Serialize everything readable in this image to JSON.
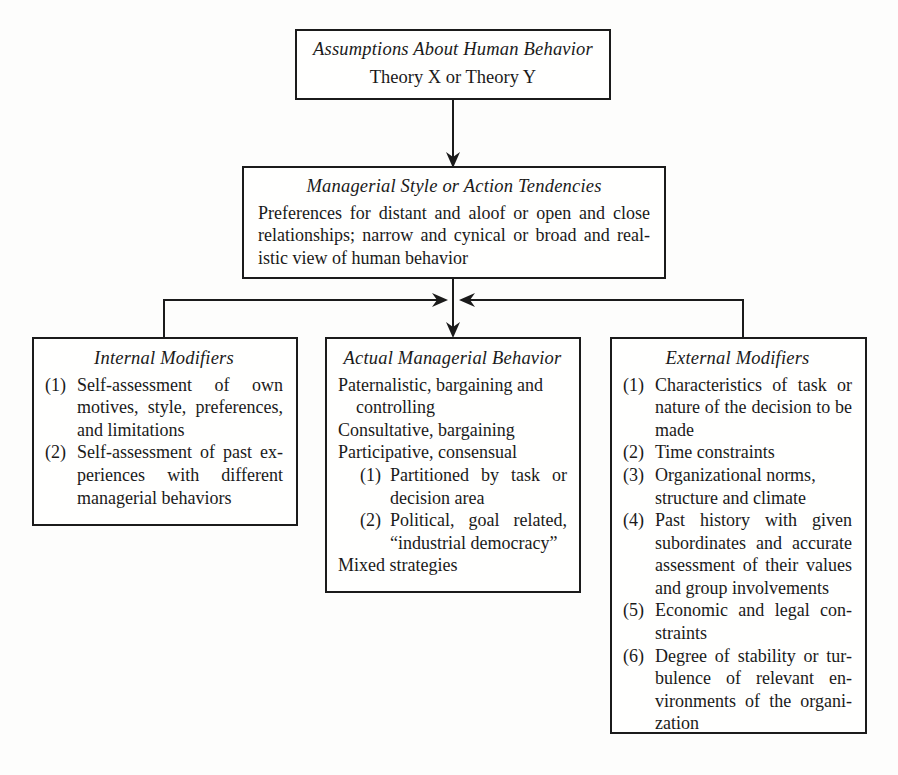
{
  "diagram": {
    "nodes": {
      "assumptions": {
        "title": "Assumptions About Human Behavior",
        "subtitle": "Theory X or Theory Y"
      },
      "style": {
        "title": "Managerial Style or Action Tendencies",
        "body": "Preferences for distant and aloof or open and close relationships; narrow and cynical or broad and real-istic view of human behavior"
      },
      "internal": {
        "title": "Internal Modifiers",
        "items": [
          {
            "marker": "(1)",
            "text": "Self-assessment of own motives, style, preferences, and limitations"
          },
          {
            "marker": "(2)",
            "text": "Self-assessment of past ex-periences with different managerial behaviors"
          }
        ]
      },
      "actual": {
        "title": "Actual Managerial Behavior",
        "lines_before": [
          "Paternalistic, bargaining and controlling",
          "Consultative, bargaining",
          "Participative, consensual"
        ],
        "items": [
          {
            "marker": "(1)",
            "text": "Partitioned by task or decision area"
          },
          {
            "marker": "(2)",
            "text": "Political, goal related, “industrial democracy”"
          }
        ],
        "lines_after": [
          "Mixed strategies"
        ]
      },
      "external": {
        "title": "External Modifiers",
        "items": [
          {
            "marker": "(1)",
            "text": "Characteristics of task or nature of the decision to be made"
          },
          {
            "marker": "(2)",
            "text": "Time constraints"
          },
          {
            "marker": "(3)",
            "text": "Organizational norms, structure and climate"
          },
          {
            "marker": "(4)",
            "text": "Past history with given subordinates and accurate assessment of their values and group involvements"
          },
          {
            "marker": "(5)",
            "text": "Economic and legal con-straints"
          },
          {
            "marker": "(6)",
            "text": "Degree of stability or tur-bulence of relevant en-vironments of the organi-zation"
          }
        ]
      }
    },
    "connectors": [
      {
        "name": "assumptions-to-style",
        "kind": "arrow-down"
      },
      {
        "name": "style-to-actual",
        "kind": "arrow-down"
      },
      {
        "name": "internal-to-center",
        "kind": "arrow-right"
      },
      {
        "name": "external-to-center",
        "kind": "arrow-left"
      }
    ],
    "colors": {
      "stroke": "#1b1b1b",
      "background": "#fdfdfc",
      "text": "#1a1a1a"
    }
  }
}
